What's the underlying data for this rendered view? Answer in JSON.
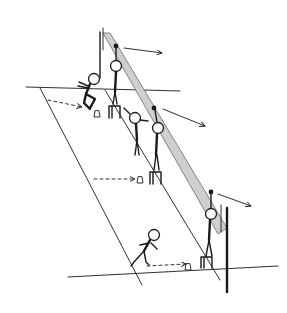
{
  "diagram": {
    "title": "",
    "colors": {
      "ink": "#1a1a1a",
      "net_fill": "#cfcfcf",
      "background": "#ffffff"
    },
    "court": {
      "far_baseline": [
        [
          26,
          87
        ],
        [
          180,
          91
        ]
      ],
      "near_baseline": [
        [
          68,
          277
        ],
        [
          278,
          266
        ]
      ],
      "left_sideline": [
        [
          40,
          88
        ],
        [
          142,
          285
        ]
      ],
      "inner_line": [
        [
          105,
          90
        ],
        [
          220,
          280
        ]
      ],
      "net_band": [
        [
          103,
          33
        ],
        [
          110,
          33
        ],
        [
          226,
          230
        ],
        [
          216,
          234
        ]
      ],
      "left_post": [
        [
          100,
          32
        ],
        [
          100,
          78
        ]
      ],
      "right_post": [
        [
          226,
          205
        ],
        [
          226,
          290
        ]
      ]
    },
    "figures": [
      {
        "id": "net-player-1",
        "head": [
          116,
          66
        ],
        "hand": [
          116,
          46
        ],
        "stand": [
          114,
          110
        ]
      },
      {
        "id": "net-player-2",
        "head": [
          158,
          128
        ],
        "hand": [
          154,
          108
        ],
        "stand": [
          155,
          182
        ]
      },
      {
        "id": "net-player-3",
        "head": [
          211,
          214
        ],
        "hand": [
          211,
          193
        ],
        "stand": [
          210,
          265
        ]
      },
      {
        "id": "crouching-player",
        "head": [
          94,
          79
        ]
      },
      {
        "id": "middle-player",
        "head": [
          135,
          118
        ]
      },
      {
        "id": "lunging-player",
        "head": [
          154,
          235
        ]
      }
    ],
    "arrows": [
      {
        "from": [
          124,
          48
        ],
        "to": [
          162,
          53
        ],
        "style": "solid"
      },
      {
        "from": [
          163,
          109
        ],
        "to": [
          205,
          126
        ],
        "style": "solid"
      },
      {
        "from": [
          218,
          194
        ],
        "to": [
          251,
          206
        ],
        "style": "solid"
      },
      {
        "from": [
          48,
          100
        ],
        "to": [
          82,
          107
        ],
        "style": "dashed"
      },
      {
        "from": [
          94,
          179
        ],
        "to": [
          135,
          179
        ],
        "style": "dashed"
      },
      {
        "from": [
          147,
          266
        ],
        "to": [
          186,
          264
        ],
        "style": "dashed"
      }
    ],
    "shuttles": [
      [
        97,
        114
      ],
      [
        140,
        180
      ],
      [
        188,
        268
      ]
    ]
  }
}
